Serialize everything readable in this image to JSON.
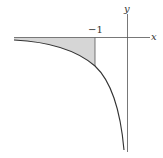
{
  "diagram": {
    "x_axis_label": "x",
    "y_axis_label": "y",
    "tick_label": "−1",
    "curve": "y = 1/x (x<0)",
    "shaded_region": "between x-axis and curve for x < -1",
    "colors": {
      "axis": "#555555",
      "curve": "#333333",
      "shade": "#d6d6d6"
    }
  }
}
